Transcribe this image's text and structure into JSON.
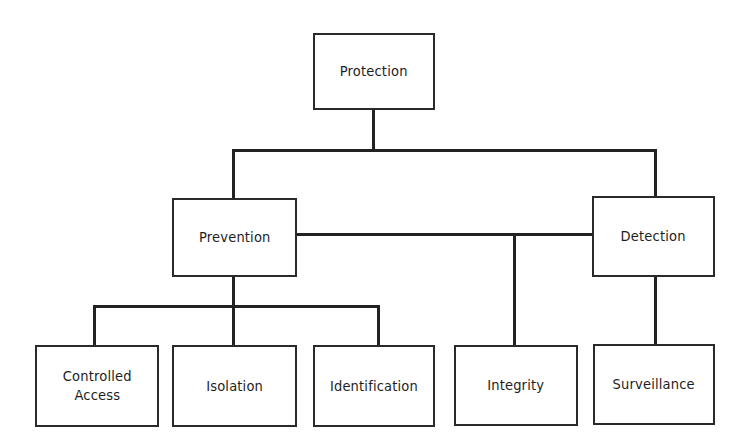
{
  "diagram": {
    "root": {
      "label": "Protection"
    },
    "level2": [
      {
        "label": "Prevention"
      },
      {
        "label": "Detection"
      }
    ],
    "level3": [
      {
        "label": "Controlled\nAccess",
        "parent": "Prevention"
      },
      {
        "label": "Isolation",
        "parent": "Prevention"
      },
      {
        "label": "Identification",
        "parent": "Prevention"
      },
      {
        "label": "Integrity",
        "parent": "Prevention / Detection"
      },
      {
        "label": "Surveillance",
        "parent": "Detection"
      }
    ]
  },
  "colors": {
    "line": "#222222",
    "text": "#1e1e1e",
    "background": "#ffffff"
  }
}
